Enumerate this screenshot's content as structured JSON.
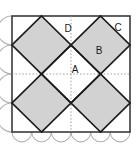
{
  "figure": {
    "type": "geometry-diagram",
    "canvas": {
      "width": 140,
      "height": 148
    },
    "colors": {
      "background": "#ffffff",
      "shape_fill": "#d2d2d2",
      "shape_stroke": "#1a1a1a",
      "frame_stroke": "#3a3a3a",
      "grid_dotted": "#9a9a9a",
      "arc_stroke": "#b4b4b4",
      "label_color": "#1a1a1a"
    },
    "frame": {
      "name": "outer-square",
      "x": 12,
      "y": 16,
      "width": 118,
      "height": 116,
      "stroke_width": 1.6
    },
    "grid": {
      "visible": true,
      "style": "dotted",
      "vertical_x": [
        41.5,
        71,
        100.5
      ],
      "horizontal_y": [
        45,
        74,
        103
      ]
    },
    "nodes": {
      "top_left_mid": [
        41.5,
        16
      ],
      "top_right_mid": [
        100.5,
        16
      ],
      "bottom_left_mid": [
        41.5,
        132
      ],
      "bottom_right_mid": [
        100.5,
        132
      ],
      "left_top_mid": [
        12,
        45
      ],
      "left_bottom_mid": [
        12,
        103
      ],
      "right_top_mid": [
        130,
        45
      ],
      "right_bottom_mid": [
        130,
        103
      ],
      "inner_top": [
        71,
        45
      ],
      "inner_left": [
        41.5,
        74
      ],
      "inner_right": [
        100.5,
        74
      ],
      "inner_bottom": [
        71,
        103
      ]
    },
    "kites": [
      {
        "name": "kite-upper-left",
        "points": "41.5,16 71,45 41.5,74 12,45"
      },
      {
        "name": "kite-upper-right",
        "points": "100.5,16 130,45 100.5,74 71,45"
      },
      {
        "name": "kite-lower-left",
        "points": "41.5,132 12,103 41.5,74 71,103"
      },
      {
        "name": "kite-lower-right",
        "points": "100.5,132 71,103 100.5,74 130,103"
      }
    ],
    "center_diamond": {
      "name": "center-diamond",
      "points": "71,45 100.5,74 71,103 41.5,74",
      "filled": false
    },
    "arcs": {
      "left_edge": {
        "name": "left-edge-scallops",
        "count": 4,
        "direction": "outward",
        "radius": 14.5
      },
      "bottom_edge": {
        "name": "bottom-edge-scallops",
        "count": 6,
        "direction": "outward",
        "radius": 9.8
      }
    },
    "labels": [
      {
        "id": "A",
        "text": "A",
        "x": 75,
        "y": 70,
        "region": "center-diamond"
      },
      {
        "id": "B",
        "text": "B",
        "x": 99,
        "y": 51,
        "region": "kite-upper-right"
      },
      {
        "id": "C",
        "text": "C",
        "x": 118,
        "y": 28,
        "region": "corner-upper-right"
      },
      {
        "id": "D",
        "text": "D",
        "x": 68,
        "y": 29,
        "region": "corner-upper-middle"
      }
    ]
  }
}
